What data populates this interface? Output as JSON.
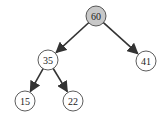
{
  "diagram": {
    "type": "binary-tree",
    "colors": {
      "highlight_fill": "#c8c8c8",
      "node_fill": "#ffffff",
      "stroke": "#333333",
      "edge": "#333333"
    },
    "nodes": [
      {
        "id": "n60",
        "label": "60",
        "cx": 96,
        "cy": 16,
        "highlighted": true
      },
      {
        "id": "n35",
        "label": "35",
        "cx": 48,
        "cy": 60,
        "highlighted": false
      },
      {
        "id": "n41",
        "label": "41",
        "cx": 146,
        "cy": 61,
        "highlighted": false
      },
      {
        "id": "n15",
        "label": "15",
        "cx": 25,
        "cy": 101,
        "highlighted": false
      },
      {
        "id": "n22",
        "label": "22",
        "cx": 73,
        "cy": 101,
        "highlighted": false
      }
    ],
    "edges": [
      {
        "from": "n60",
        "to": "n35"
      },
      {
        "from": "n60",
        "to": "n41"
      },
      {
        "from": "n35",
        "to": "n15"
      },
      {
        "from": "n35",
        "to": "n22"
      }
    ]
  }
}
